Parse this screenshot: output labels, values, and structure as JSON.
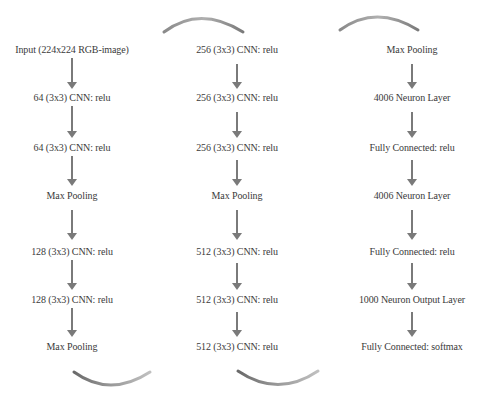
{
  "diagram": {
    "title": "",
    "colors": {
      "text": "#3a3a3a",
      "arrow": "#7a7a7a",
      "background": "#ffffff"
    },
    "columns": [
      {
        "id": "col1",
        "center_x": 72,
        "nodes": [
          {
            "label": "Input (224x224 RGB-image)",
            "y": 49
          },
          {
            "label": "64 (3x3) CNN: relu",
            "y": 97
          },
          {
            "label": "64 (3x3) CNN: relu",
            "y": 147
          },
          {
            "label": "Max Pooling",
            "y": 195
          },
          {
            "label": "128 (3x3) CNN: relu",
            "y": 251
          },
          {
            "label": "128 (3x3) CNN: relu",
            "y": 299
          },
          {
            "label": "Max Pooling",
            "y": 346
          }
        ]
      },
      {
        "id": "col2",
        "center_x": 237,
        "nodes": [
          {
            "label": "256 (3x3) CNN: relu",
            "y": 49
          },
          {
            "label": "256 (3x3) CNN: relu",
            "y": 97
          },
          {
            "label": "256 (3x3) CNN: relu",
            "y": 147
          },
          {
            "label": "Max Pooling",
            "y": 195
          },
          {
            "label": "512 (3x3) CNN: relu",
            "y": 251
          },
          {
            "label": "512 (3x3) CNN: relu",
            "y": 299
          },
          {
            "label": "512 (3x3) CNN: relu",
            "y": 346
          }
        ]
      },
      {
        "id": "col3",
        "center_x": 412,
        "nodes": [
          {
            "label": "Max Pooling",
            "y": 49
          },
          {
            "label": "4006 Neuron Layer",
            "y": 97
          },
          {
            "label": "Fully Connected: relu",
            "y": 147
          },
          {
            "label": "4006 Neuron Layer",
            "y": 195
          },
          {
            "label": "Fully Connected: relu",
            "y": 251
          },
          {
            "label": "1000 Neuron Output Layer",
            "y": 299
          },
          {
            "label": "Fully Connected: softmax",
            "y": 346
          }
        ]
      }
    ],
    "connectors": [
      {
        "from": "col1.bottom",
        "to": "col2.top",
        "type": "curved-arrow",
        "position": "bottom-left"
      },
      {
        "from": "col2.bottom",
        "to": "col3.top",
        "type": "curved-arrow",
        "position": "bottom-right"
      },
      {
        "type": "curved-arrow",
        "position": "top-left"
      },
      {
        "type": "curved-arrow",
        "position": "top-right"
      }
    ]
  }
}
